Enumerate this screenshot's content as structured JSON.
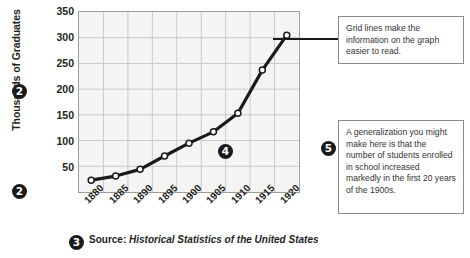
{
  "chart_data": {
    "type": "line",
    "title": "",
    "xlabel": "",
    "ylabel": "Thousands of Graduates",
    "x": [
      1880,
      1885,
      1890,
      1895,
      1900,
      1905,
      1910,
      1915,
      1920
    ],
    "categories": [
      "1880",
      "1885",
      "1890",
      "1895",
      "1900",
      "1905",
      "1910",
      "1915",
      "1920"
    ],
    "values": [
      23,
      31,
      44,
      70,
      95,
      117,
      153,
      237,
      305
    ],
    "series": [
      {
        "name": "Thousands of Graduates",
        "values": [
          23,
          31,
          44,
          70,
          95,
          117,
          153,
          237,
          305
        ]
      }
    ],
    "ylim": [
      0,
      350
    ],
    "y_ticks": [
      50,
      100,
      150,
      200,
      250,
      300,
      350
    ],
    "y_tick_labels": [
      "50",
      "100",
      "150",
      "200",
      "250",
      "300",
      "350"
    ],
    "xlim": [
      1880,
      1920
    ],
    "grid": true,
    "legend": false,
    "marker": "open-circle",
    "line_color": "#1a1a1a",
    "plot_background": "#f4f4f4",
    "grid_color": "#c9c9c9"
  },
  "axes": {
    "y_title": "Thousands of Graduates"
  },
  "source": {
    "label": "Source:",
    "text": "Historical Statistics of the United States"
  },
  "callouts": [
    {
      "id": "num-2-axis-y",
      "number": "2"
    },
    {
      "id": "num-2-axis-x",
      "number": "2"
    },
    {
      "id": "num-3-source",
      "number": "3"
    },
    {
      "id": "num-4-line",
      "number": "4"
    },
    {
      "id": "num-5-gen",
      "number": "5"
    }
  ],
  "annotations": {
    "gridlines": "Grid lines make the information on the graph easier to read.",
    "generalization": "A generalization you might make here is that the number of students enrolled in school increased markedly in the first 20 years of the 1900s."
  },
  "colors": {
    "ink": "#231f20",
    "line": "#1a1a1a",
    "plot_bg": "#f4f4f4",
    "grid": "#c9c9c9",
    "frame": "#9d9d9d",
    "box_border": "#8b8b8b"
  }
}
